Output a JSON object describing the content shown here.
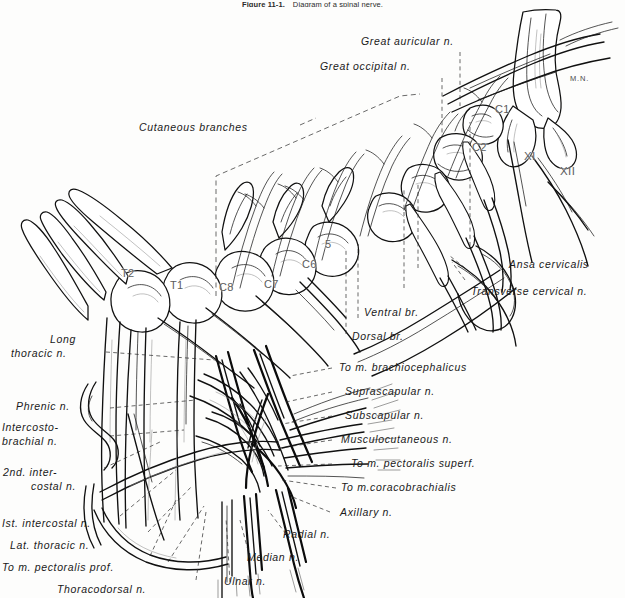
{
  "figure": {
    "caption_number": "Figure 11-1.",
    "caption_text": "Diagram of a spinal nerve.",
    "style": "pen-and-ink anatomical line drawing, monochrome",
    "ink_color": "#121212",
    "background_color": "#fdfdfc"
  },
  "labels": {
    "great_auricular": "Great auricular n.",
    "great_occipital": "Great occipital n.",
    "cutaneous_branches": "Cutaneous branches",
    "ansa_cervicalis": "Ansa cervicalis",
    "transverse_cervical": "Transverse cervical n.",
    "ventral_br": "Ventral br.",
    "dorsal_br": "Dorsal br.",
    "to_m_brachiocephalicus": "To m. brachiocephalicus",
    "suprascapular": "Suprascapular n.",
    "subscapular": "Subscapular n.",
    "musculocutaneous": "Musculocutaneous n.",
    "to_m_pectoralis_superf": "To m. pectoralis superf.",
    "to_m_coracobrachialis": "To m.coracobrachialis",
    "axillary": "Axillary n.",
    "radial": "Radial n.",
    "median": "Median n.",
    "ulnar": "Ulnar n.",
    "long_thoracic_l1": "Long",
    "long_thoracic_l2": "thoracic n.",
    "phrenic": "Phrenic n.",
    "intercostobrachial_l1": "Intercosto-",
    "intercostobrachial_l2": "brachial n.",
    "second_intercostal_l1": "2nd. inter-",
    "second_intercostal_l2": "costal n.",
    "first_intercostal": "Ist. intercostal n.",
    "lat_thoracic": "Lat. thoracic n.",
    "to_m_pectoralis_prof": "To m. pectoralis prof.",
    "thoracodorsal": "Thoracodorsal n."
  },
  "segments": {
    "t2": "T2",
    "t1": "T1",
    "c8": "C8",
    "c7": "C7",
    "c6": "C6",
    "c5": "5",
    "c2": "C2",
    "c1": "C1",
    "cranial_xi": "XI",
    "cranial_xii": "XII",
    "median_nerve_mark": "M.N."
  }
}
